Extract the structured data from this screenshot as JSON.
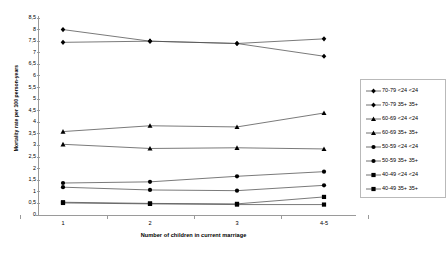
{
  "chart_data": {
    "type": "line",
    "title": "",
    "xlabel": "Number of children in current marriage",
    "ylabel": "Mortality rate per 100 person-years",
    "categories": [
      "1",
      "2",
      "3",
      "4-5"
    ],
    "ylim": [
      0,
      8.5
    ],
    "ytick_labels": [
      "0",
      "0,5",
      "1",
      "1,5",
      "2",
      "2,5",
      "3",
      "3,5",
      "4",
      "4,5",
      "5",
      "5,5",
      "6",
      "6,5",
      "7",
      "7,5",
      "8",
      "8,5"
    ],
    "ytick_values": [
      0,
      0.5,
      1,
      1.5,
      2,
      2.5,
      3,
      3.5,
      4,
      4.5,
      5,
      5.5,
      6,
      6.5,
      7,
      7.5,
      8,
      8.5
    ],
    "grid": false,
    "legend_position": "right",
    "decimal_separator": ",",
    "line_color": "#4d4d4d",
    "marker_color": "#000000",
    "series": [
      {
        "name": "70-79 <24 <24",
        "marker": "diamond",
        "values": [
          8.0,
          7.5,
          7.4,
          6.85
        ]
      },
      {
        "name": "70-79 35+ 35+",
        "marker": "diamond",
        "values": [
          7.45,
          7.5,
          7.4,
          7.6
        ]
      },
      {
        "name": "60-69 <24 <24",
        "marker": "triangle",
        "values": [
          3.6,
          3.85,
          3.8,
          4.4
        ]
      },
      {
        "name": "60-69 35+ 35+",
        "marker": "triangle",
        "values": [
          3.05,
          2.87,
          2.9,
          2.85
        ]
      },
      {
        "name": "50-59 <24 <24",
        "marker": "circle",
        "values": [
          1.38,
          1.43,
          1.67,
          1.87
        ]
      },
      {
        "name": "50-59 35+ 35+",
        "marker": "circle",
        "values": [
          1.2,
          1.08,
          1.05,
          1.28
        ]
      },
      {
        "name": "40-49 <24 <24",
        "marker": "square",
        "values": [
          0.55,
          0.5,
          0.48,
          0.78
        ]
      },
      {
        "name": "40-49 35+ 35+",
        "marker": "square",
        "values": [
          0.52,
          0.48,
          0.45,
          0.45
        ]
      }
    ]
  }
}
